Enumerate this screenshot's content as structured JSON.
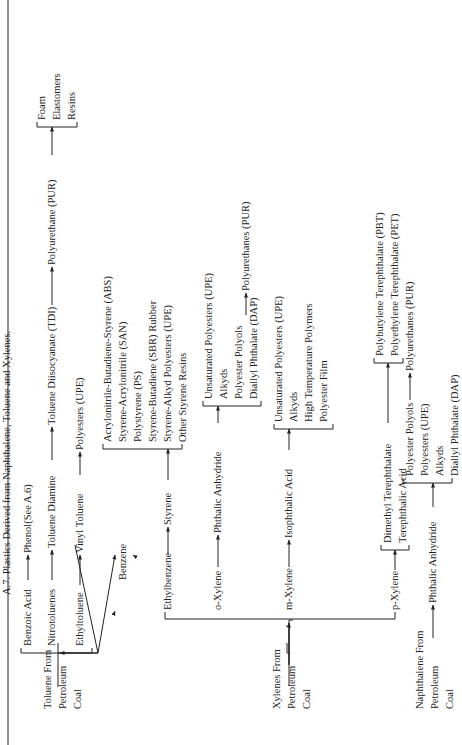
{
  "title": "A.7.  Plastics Derived from Naphthalene, Toluene and Xylenes.",
  "sources": {
    "toluene": [
      "Toluene From",
      "Petroleum",
      "Coal"
    ],
    "xylenes": [
      "Xylenes From",
      "Petroleum",
      "Coal"
    ],
    "naphthalene": [
      "Naphthalene From",
      "Petroleum",
      "Coal"
    ]
  },
  "toluene_branch": {
    "benzoic_acid": "Benzoic Acid",
    "phenol": "Phenol(See A.6)",
    "nitrotoluenes": "Nitrotoluenes",
    "toluene_diamine": "Toluene Diamine",
    "tdi": "Toluene Diisocyanate (TDI)",
    "polyurethane": "Polyurethane (PUR)",
    "pur_products": [
      "Foam",
      "Elastomers",
      "Resins"
    ],
    "ethyltoluene": "Ethyltoluene",
    "vinyl_toluene": "Vinyl Toluene",
    "polyesters_upe": "Polyesters (UPE)"
  },
  "benzene": "Benzene",
  "xylene_branch": {
    "ethylbenzene": "Ethylbenzene",
    "styrene": "Styrene",
    "styrene_products": [
      "Acrylonitrile-Butadiene-Styrene (ABS)",
      "Styrene-Acrylonitrile (SAN)",
      "Polystyrene (PS)",
      "Styrene-Butadiene (SBR) Rubber",
      "Styrene-Alkyd Polyesters (UPE)",
      "Other Styrene Resins"
    ],
    "o_xylene": "o-Xylene",
    "phthalic_anhydride": "Phthalic Anhydride",
    "pa_products": [
      "Unsaturated Polyesters (UPE)",
      "Alkyds",
      "Polyester Polyols",
      "Diallyl Phthalate (DAP)"
    ],
    "pa_polyurethanes": "Polyurethanes (PUR)",
    "m_xylene": "m-Xylene",
    "isophthalic_acid": "Isophthalic Acid",
    "ia_products": [
      "Unsaturated Polyesters (UPE)",
      "Alkyds",
      "High Temperature Polymers",
      "Polyester Film"
    ],
    "p_xylene": "p-Xylene",
    "p_products": [
      "Dimethyl Terephthalate",
      "Terephthalic Acid"
    ],
    "terephthalate_products": [
      "Polybutylene Terephthalate (PBT)",
      "Polyethylene Terephthalate (PET)"
    ]
  },
  "naphthalene_branch": {
    "phthalic_anhydride": "Phthalic Anhydride",
    "products": [
      "Polyester Polyols",
      "Polyesters (UPE)",
      "Alkyds",
      "Diallyl Phthalate (DAP)"
    ],
    "polyurethanes": "Polyurethanes (PUR)"
  }
}
